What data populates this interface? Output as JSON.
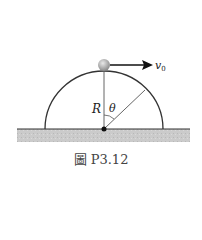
{
  "figure": {
    "caption": "圖 P3.12",
    "labels": {
      "radius": "R",
      "angle": "θ",
      "velocity": "v",
      "velocity_sub": "0"
    },
    "colors": {
      "ground": "#c8c8c8",
      "line": "#333333",
      "ball": "#b0b0b0"
    }
  }
}
